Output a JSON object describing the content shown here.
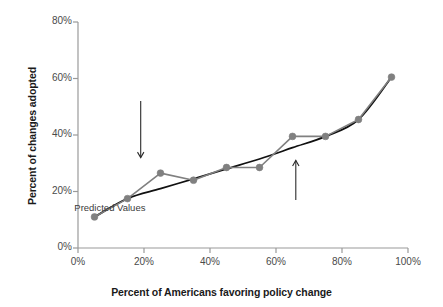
{
  "chart_data": {
    "type": "line",
    "title": "",
    "xlabel": "Percent of Americans favoring policy change",
    "ylabel": "Percent of changes adopted",
    "xlim": [
      0,
      100
    ],
    "ylim": [
      0,
      80
    ],
    "grid": false,
    "legend_position": "none",
    "x_ticks": [
      "0%",
      "20%",
      "40%",
      "60%",
      "80%",
      "100%"
    ],
    "x_tick_values": [
      0,
      20,
      40,
      60,
      80,
      100
    ],
    "y_ticks": [
      "0%",
      "20%",
      "40%",
      "60%",
      "80%"
    ],
    "y_tick_values": [
      0,
      20,
      40,
      60,
      80
    ],
    "x": [
      5,
      15,
      25,
      35,
      45,
      55,
      65,
      75,
      85,
      95
    ],
    "series": [
      {
        "name": "Observed Values",
        "color": "#808080",
        "marker": "circle",
        "values": [
          11,
          17.5,
          26.5,
          24,
          28.5,
          28.5,
          39.5,
          39.5,
          45.5,
          60.5
        ]
      },
      {
        "name": "Predicted Values",
        "color": "#111111",
        "marker": "none",
        "values": [
          11,
          17.5,
          21,
          24.5,
          28,
          31.5,
          35.5,
          39.5,
          45.5,
          60.5
        ]
      }
    ],
    "annotations": [
      {
        "label": "Observed Values",
        "text_x": 19,
        "text_y": 56,
        "arrow_from_x": 19,
        "arrow_from_y": 52,
        "arrow_to_x": 19,
        "arrow_to_y": 32,
        "direction": "down"
      },
      {
        "label": "Predicted Values",
        "text_x": 66,
        "text_y": 14,
        "arrow_from_x": 66,
        "arrow_from_y": 17,
        "arrow_to_x": 66,
        "arrow_to_y": 31,
        "direction": "up"
      }
    ]
  },
  "axes": {
    "y_title": "Percent of changes adopted",
    "x_title": "Percent of Americans favoring policy change",
    "axis_color": "#9a9a9a"
  },
  "colors": {
    "observed": "#808080",
    "predicted": "#111111",
    "axis": "#9a9a9a",
    "text": "#1a1a1a",
    "tick_text": "#4a4a4a",
    "background": "#ffffff"
  }
}
